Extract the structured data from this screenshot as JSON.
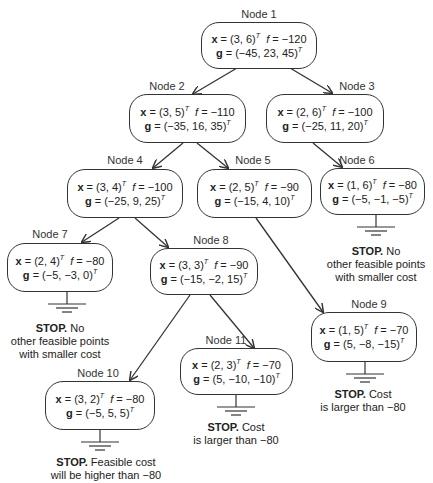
{
  "diagram": {
    "type": "branch-and-bound-tree",
    "colors": {
      "stroke": "#333333",
      "text": "#222222",
      "background": "#ffffff"
    },
    "nodes": [
      {
        "id": "1",
        "label": "Node 1",
        "x": "(3, 6)",
        "f": "−120",
        "g": "(−45, 23, 45)",
        "box": [
          201,
          22,
          116,
          47
        ],
        "label_pos": [
          259,
          8
        ]
      },
      {
        "id": "2",
        "label": "Node 2",
        "x": "(3, 5)",
        "f": "−110",
        "g": "(−35, 16, 35)",
        "box": [
          129,
          94,
          117,
          49
        ],
        "label_pos": [
          167,
          80
        ]
      },
      {
        "id": "3",
        "label": "Node 3",
        "x": "(2, 6)",
        "f": "−100",
        "g": "(−25, 11, 20)",
        "box": [
          266,
          94,
          118,
          49
        ],
        "label_pos": [
          357,
          80
        ]
      },
      {
        "id": "4",
        "label": "Node 4",
        "x": "(3, 4)",
        "f": "−100",
        "g": "(−25, 9, 25)",
        "box": [
          67,
          169,
          116,
          49
        ],
        "label_pos": [
          125,
          154
        ]
      },
      {
        "id": "5",
        "label": "Node 5",
        "x": "(2, 5)",
        "f": "−90",
        "g": "(−15, 4, 10)",
        "box": [
          197,
          169,
          115,
          49
        ],
        "label_pos": [
          253,
          154
        ]
      },
      {
        "id": "6",
        "label": "Node 6",
        "x": "(1, 6)",
        "f": "−80",
        "g": "(−5, −1, −5)",
        "box": [
          320,
          168,
          105,
          47
        ],
        "label_pos": [
          357,
          154
        ]
      },
      {
        "id": "7",
        "label": "Node 7",
        "x": "(2, 4)",
        "f": "−80",
        "g": "(−5, −3, 0)",
        "box": [
          7,
          243,
          106,
          49
        ],
        "label_pos": [
          50,
          228
        ]
      },
      {
        "id": "8",
        "label": "Node 8",
        "x": "(3, 3)",
        "f": "−90",
        "g": "(−15, −2, 15)",
        "box": [
          150,
          248,
          108,
          47
        ],
        "label_pos": [
          211,
          234
        ]
      },
      {
        "id": "9",
        "label": "Node 9",
        "x": "(1, 5)",
        "f": "−70",
        "g": "(5, −8, −15)",
        "box": [
          311,
          312,
          106,
          50
        ],
        "label_pos": [
          369,
          298
        ]
      },
      {
        "id": "10",
        "label": "Node 10",
        "x": "(3, 2)",
        "f": "−80",
        "g": "(−5, 5, 5)",
        "box": [
          45,
          381,
          110,
          49
        ],
        "label_pos": [
          98,
          367
        ]
      },
      {
        "id": "11",
        "label": "Node 11",
        "x": "(2, 3)",
        "f": "−70",
        "g": "(5, −10, −10)",
        "box": [
          180,
          348,
          113,
          47
        ],
        "label_pos": [
          226,
          334
        ]
      }
    ],
    "edges": [
      {
        "from": "1",
        "to": "2",
        "path": [
          237,
          68,
          193,
          94
        ]
      },
      {
        "from": "1",
        "to": "3",
        "path": [
          290,
          68,
          332,
          93
        ]
      },
      {
        "from": "2",
        "to": "4",
        "path": [
          183,
          143,
          153,
          168
        ]
      },
      {
        "from": "2",
        "to": "5",
        "path": [
          197,
          143,
          228,
          168
        ]
      },
      {
        "from": "3",
        "to": "6",
        "path": [
          313,
          143,
          342,
          167
        ]
      },
      {
        "from": "4",
        "to": "7",
        "path": [
          119,
          218,
          82,
          242
        ]
      },
      {
        "from": "4",
        "to": "8",
        "path": [
          135,
          218,
          168,
          247
        ]
      },
      {
        "from": "5",
        "to": "9",
        "path": [
          256,
          218,
          323,
          312
        ]
      },
      {
        "from": "8",
        "to": "10",
        "path": [
          190,
          295,
          130,
          380
        ]
      },
      {
        "from": "8",
        "to": "11",
        "path": [
          210,
          295,
          254,
          348
        ]
      }
    ],
    "stops": [
      {
        "node": "6",
        "ground": [
          376,
          215
        ],
        "bold": "STOP.",
        "text_lines": [
          " No",
          "other feasible points",
          "with smaller cost"
        ],
        "pos": [
          376,
          245
        ]
      },
      {
        "node": "7",
        "ground": [
          67,
          292
        ],
        "bold": "STOP.",
        "text_lines": [
          " No",
          "other feasible points",
          "with smaller cost"
        ],
        "pos": [
          60,
          322
        ]
      },
      {
        "node": "9",
        "ground": [
          365,
          362
        ],
        "bold": "STOP.",
        "text_lines": [
          " Cost",
          "is larger than −80"
        ],
        "pos": [
          363,
          388
        ]
      },
      {
        "node": "11",
        "ground": [
          236,
          395
        ],
        "bold": "STOP.",
        "text_lines": [
          " Cost",
          "is larger than −80"
        ],
        "pos": [
          236,
          421
        ]
      },
      {
        "node": "10",
        "ground": [
          100,
          430
        ],
        "bold": "STOP.",
        "text_lines": [
          " Feasible cost",
          "will be higher than −80"
        ],
        "pos": [
          106,
          456
        ]
      }
    ]
  }
}
